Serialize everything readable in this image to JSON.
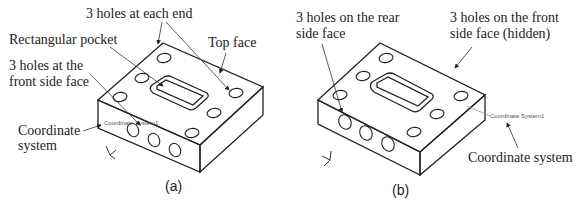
{
  "figure": {
    "panel_a": {
      "caption": "(a)",
      "labels": {
        "holes_each_end": "3 holes at each end",
        "rect_pocket": "Rectangular pocket",
        "top_face": "Top face",
        "front_holes_line1": "3 holes at the",
        "front_holes_line2": "front side face",
        "coord_line1": "Coordinate",
        "coord_line2": "system"
      },
      "cad_tag": "Coordinate System1"
    },
    "panel_b": {
      "caption": "(b)",
      "labels": {
        "rear_holes_line1": "3 holes on the rear",
        "rear_holes_line2": "side face",
        "front_hidden_line1": "3 holes on the front",
        "front_hidden_line2": "side face (hidden)",
        "coord": "Coordinate system"
      },
      "cad_tag": "Coordinate System1"
    }
  }
}
